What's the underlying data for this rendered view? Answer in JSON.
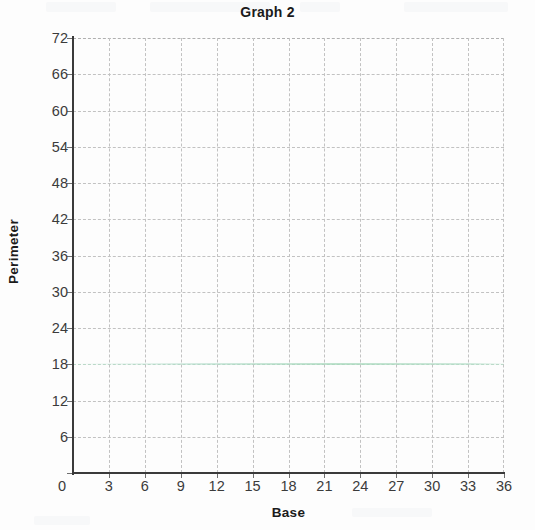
{
  "chart_data": {
    "type": "scatter",
    "title": "Graph 2",
    "xlabel": "Base",
    "ylabel": "Perimeter",
    "xlim": [
      0,
      36
    ],
    "ylim": [
      0,
      72
    ],
    "xticks": [
      0,
      3,
      6,
      9,
      12,
      15,
      18,
      21,
      24,
      27,
      30,
      33,
      36
    ],
    "yticks": [
      0,
      6,
      12,
      18,
      24,
      30,
      36,
      42,
      48,
      54,
      60,
      66,
      72
    ],
    "xtick_labels": [
      "0",
      "3",
      "6",
      "9",
      "12",
      "15",
      "18",
      "21",
      "24",
      "27",
      "30",
      "33",
      "36"
    ],
    "ytick_labels": [
      "0",
      "6",
      "12",
      "18",
      "24",
      "30",
      "36",
      "42",
      "48",
      "54",
      "60",
      "66",
      "72"
    ],
    "grid": true,
    "grid_style": "dashed",
    "legend": false,
    "series": [],
    "x": [],
    "values": [],
    "annotations": []
  },
  "colors": {
    "background": "#fdfdfd",
    "axis": "#3a3a3a",
    "grid": "#c2c2c2",
    "tick_label": "#3b3b3b",
    "title": "#1b1b1b",
    "artifact_tint": "#a8d8bc"
  },
  "artifact": {
    "tinted_gridline_value": 18,
    "tinted_gridline_label": "18"
  }
}
